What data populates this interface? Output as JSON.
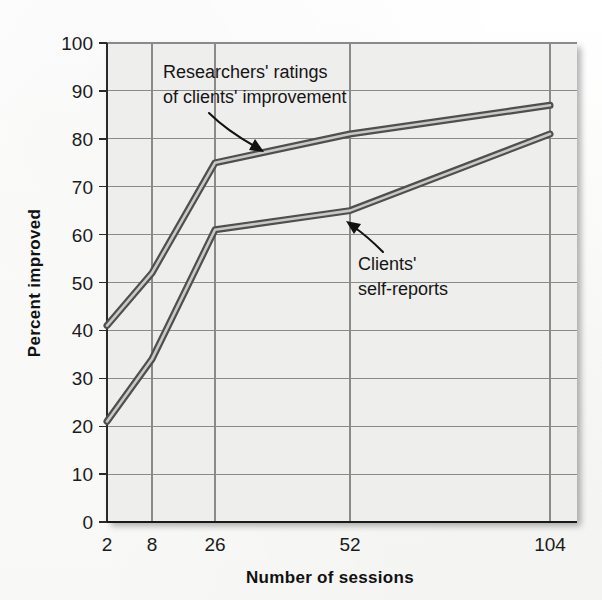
{
  "chart_data": {
    "type": "line",
    "title": "",
    "xlabel": "Number of sessions",
    "ylabel": "Percent improved",
    "x": [
      2,
      8,
      26,
      52,
      104
    ],
    "xtick_labels": [
      "2",
      "8",
      "26",
      "52",
      "104"
    ],
    "ytick_labels": [
      "0",
      "10",
      "20",
      "30",
      "40",
      "50",
      "60",
      "70",
      "80",
      "90",
      "100"
    ],
    "ylim": [
      0,
      100
    ],
    "ytick_step": 10,
    "grid": true,
    "legend": "none",
    "series": [
      {
        "name": "Researchers' ratings of clients' improvement",
        "values": [
          41,
          52,
          75,
          81,
          87
        ],
        "color": "#6e6e6e"
      },
      {
        "name": "Clients' self-reports",
        "values": [
          21,
          34,
          61,
          65,
          81
        ],
        "color": "#6e6e6e"
      }
    ],
    "annotations": [
      {
        "id": "researchers-annotation",
        "line1": "Researchers' ratings",
        "line2": "of clients' improvement",
        "arrow": "points-down-right-to-upper-curve"
      },
      {
        "id": "clients-annotation",
        "line1": "Clients'",
        "line2": "self-reports",
        "arrow": "points-up-left-to-lower-curve"
      }
    ]
  },
  "axis": {
    "y_title": "Percent improved",
    "x_title": "Number of sessions"
  },
  "ticks": {
    "y": [
      "100",
      "90",
      "80",
      "70",
      "60",
      "50",
      "40",
      "30",
      "20",
      "10",
      "0"
    ],
    "x": [
      "2",
      "8",
      "26",
      "52",
      "104"
    ]
  },
  "annotations": {
    "researchers_line1": "Researchers' ratings",
    "researchers_line2": "of clients' improvement",
    "clients_line1": "Clients'",
    "clients_line2": "self-reports"
  },
  "colors": {
    "line": "#6e6e6e",
    "line_dark": "#565656",
    "grid": "#8a8a8a",
    "axis": "#1f1f1f",
    "plot_bg": "#eeeeec",
    "text": "#151515"
  }
}
